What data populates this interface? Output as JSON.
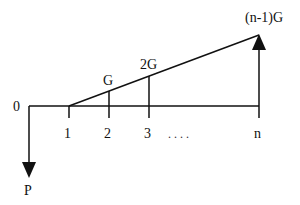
{
  "diagram": {
    "type": "cash-flow-diagram",
    "time_labels": [
      "0",
      "1",
      "2",
      "3",
      "n"
    ],
    "ellipsis": ". . . .",
    "cash_flows": [
      {
        "period": "0",
        "direction": "down",
        "label": "P"
      },
      {
        "period": "2",
        "label": "G"
      },
      {
        "period": "3",
        "label": "2G"
      },
      {
        "period": "n",
        "direction": "up",
        "label": "(n-1)G"
      }
    ],
    "labels": {
      "zero": "0",
      "one": "1",
      "two": "2",
      "three": "3",
      "n": "n",
      "P": "P",
      "G": "G",
      "twoG": "2G",
      "nMinus1G": "(n-1)G"
    }
  }
}
